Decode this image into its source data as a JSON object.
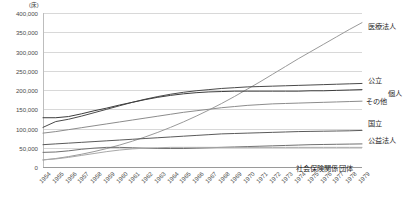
{
  "chart_data": {
    "type": "line",
    "title": "",
    "subtitle": "",
    "unit_label": "(床)",
    "xlabel": "",
    "ylabel": "",
    "ylim": [
      0,
      400000
    ],
    "ytick_step": 50000,
    "grid": true,
    "legend_position": "right-inline",
    "ytick_labels": [
      "400,000",
      "350,000",
      "300,000",
      "250,000",
      "200,000",
      "150,000",
      "100,000",
      "50,000",
      "0"
    ],
    "ytick_values": [
      400000,
      350000,
      300000,
      250000,
      200000,
      150000,
      100000,
      50000,
      0
    ],
    "categories": [
      "1954",
      "1955",
      "1956",
      "1957",
      "1958",
      "1959",
      "1960",
      "1961",
      "1962",
      "1963",
      "1964",
      "1965",
      "1966",
      "1967",
      "1968",
      "1969",
      "1970",
      "1971",
      "1972",
      "1973",
      "1974",
      "1975",
      "1976",
      "1977",
      "1978",
      "1979"
    ],
    "series": [
      {
        "name": "医療法人",
        "color": "#9a9a9a",
        "label_x": 368,
        "label_y": 21,
        "values": [
          18000,
          22000,
          27000,
          33000,
          40000,
          48000,
          57000,
          67000,
          78000,
          90000,
          103000,
          117000,
          132000,
          148000,
          165000,
          183000,
          202000,
          221000,
          241000,
          261000,
          281000,
          300000,
          319000,
          338000,
          357000,
          375000
        ]
      },
      {
        "name": "公立",
        "color": "#4a4a4a",
        "label_x": 368,
        "label_y": 75,
        "values": [
          103000,
          118000,
          124000,
          132000,
          141000,
          150000,
          159000,
          168000,
          176000,
          183000,
          189000,
          194000,
          198000,
          201000,
          204000,
          206000,
          208000,
          209000,
          210000,
          211000,
          212000,
          213000,
          214000,
          215000,
          216000,
          217000
        ]
      },
      {
        "name": "個人",
        "color": "#3d3d3d",
        "label_x": 388,
        "label_y": 88,
        "values": [
          128000,
          128000,
          131000,
          138000,
          146000,
          153000,
          161000,
          168000,
          175000,
          181000,
          186000,
          190000,
          193000,
          195000,
          196000,
          197000,
          197000,
          197000,
          197000,
          197000,
          197000,
          198000,
          198000,
          199000,
          200000,
          201000
        ]
      },
      {
        "name": "その他",
        "color": "#8c8c8c",
        "label_x": 366,
        "label_y": 96,
        "values": [
          88000,
          92000,
          97000,
          102000,
          107000,
          112000,
          117000,
          122000,
          127000,
          132000,
          137000,
          142000,
          146000,
          150000,
          154000,
          157000,
          160000,
          162000,
          164000,
          165000,
          166000,
          167000,
          168000,
          169000,
          170000,
          171000
        ]
      },
      {
        "name": "国立",
        "color": "#5a5a5a",
        "label_x": 368,
        "label_y": 118,
        "values": [
          58000,
          60000,
          62000,
          64000,
          66000,
          68000,
          70000,
          72000,
          74000,
          76000,
          78000,
          80000,
          82000,
          84000,
          86000,
          87000,
          88000,
          89000,
          90000,
          91000,
          92000,
          92500,
          93000,
          93500,
          94000,
          95000
        ]
      },
      {
        "name": "公益法人",
        "color": "#707070",
        "label_x": 368,
        "label_y": 135,
        "values": [
          38000,
          39000,
          42000,
          46000,
          49000,
          51000,
          51000,
          50000,
          49000,
          48000,
          48000,
          48000,
          49000,
          50000,
          51000,
          52000,
          53000,
          54000,
          55000,
          56000,
          57000,
          58000,
          58500,
          59000,
          59500,
          60000
        ]
      },
      {
        "name": "社会保険関係団体",
        "color": "#a8a8a8",
        "label_x": 296,
        "label_y": 163,
        "values": [
          19000,
          21000,
          25000,
          30000,
          35000,
          40000,
          44000,
          47000,
          49000,
          50000,
          51000,
          51000,
          51000,
          51000,
          51000,
          51000,
          51000,
          51000,
          51000,
          51000,
          51000,
          51000,
          51000,
          51000,
          51000,
          51000
        ]
      }
    ]
  }
}
